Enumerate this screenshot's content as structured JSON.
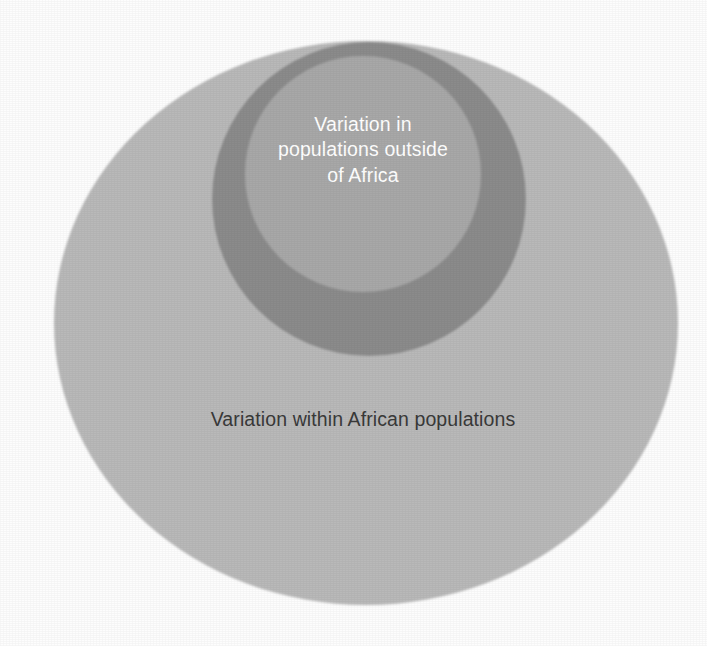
{
  "figure": {
    "type": "venn-nested-circles",
    "background_color": "#fdfdfd",
    "title": "",
    "regions": [
      {
        "id": "african-variation",
        "name": "outer-ellipse",
        "label": "Variation within African populations",
        "fill_color": "#b9b9b9",
        "text_color": "#3a3a3a",
        "shape": "ellipse",
        "cx": 366,
        "cy": 323,
        "rx": 312,
        "ry": 282
      },
      {
        "id": "ring-band",
        "name": "dark-ring-circle",
        "label": "",
        "fill_color": "#8b8b8b",
        "shape": "circle",
        "cx": 369,
        "cy": 199,
        "r": 157
      },
      {
        "id": "non-african-variation",
        "name": "inner-circle",
        "label": "Variation in\npopulations outside\nof Africa",
        "fill_color": "#a8a8a8",
        "text_color": "#ffffff",
        "shape": "circle",
        "cx": 363,
        "cy": 174,
        "r": 118
      }
    ]
  },
  "labels": {
    "outside_africa": "Variation in\npopulations outside\nof Africa",
    "within_africa": "Variation within African populations"
  },
  "colors": {
    "background": "#fdfdfd",
    "outer_fill": "#b9b9b9",
    "ring_fill": "#8b8b8b",
    "inner_fill": "#a8a8a8",
    "light_text": "#ffffff",
    "dark_text": "#3a3a3a"
  }
}
